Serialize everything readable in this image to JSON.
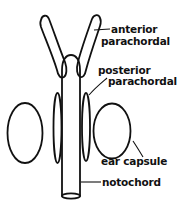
{
  "diagram": {
    "labels": {
      "anterior_parachordal_1": "anterior",
      "anterior_parachordal_2": "parachordal",
      "posterior_parachordal_1": "posterior",
      "posterior_parachordal_2": "parachordal",
      "ear_capsule": "ear capsule",
      "notochord": "notochord"
    },
    "colors": {
      "line": "#111111",
      "background": "#ffffff"
    }
  }
}
